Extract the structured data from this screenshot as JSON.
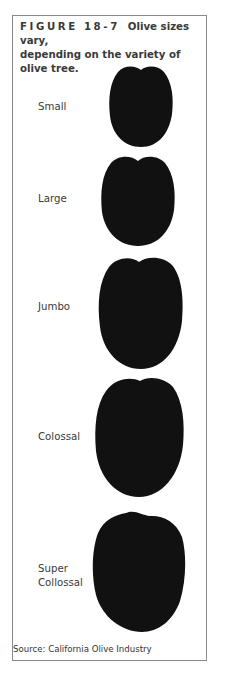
{
  "figure": {
    "number_label": "FIGURE 18-7",
    "caption_line1": "Olive sizes vary,",
    "caption_line2": "depending on the variety of olive tree.",
    "source": "Source: California Olive Industry"
  },
  "olives": [
    {
      "label": "Small"
    },
    {
      "label": "Large"
    },
    {
      "label": "Jumbo"
    },
    {
      "label": "Colossal"
    },
    {
      "label_line1": "Super",
      "label_line2": "Collossal"
    }
  ],
  "colors": {
    "olive": "#111111",
    "frame": "#8a8a8a"
  }
}
